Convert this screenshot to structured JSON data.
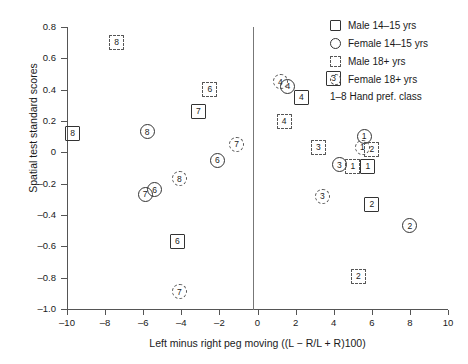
{
  "chart_data": {
    "type": "scatter",
    "title": "",
    "xlabel": "Left minus right peg moving ((L − R/L + R)100)",
    "ylabel": "Spatial test standard scores",
    "xlim": [
      -10,
      10
    ],
    "ylim": [
      -1.0,
      0.8
    ],
    "xticks": [
      -10,
      -8,
      -6,
      -4,
      -2,
      0,
      2,
      4,
      6,
      8,
      10
    ],
    "xtick_labels": [
      "–10",
      "–8",
      "–6",
      "–4",
      "–2",
      "0",
      "2",
      "4",
      "6",
      "8",
      "10"
    ],
    "yticks": [
      0.8,
      0.6,
      0.4,
      0.2,
      0,
      -0.2,
      -0.4,
      -0.6,
      -0.8,
      -1.0
    ],
    "ytick_labels": [
      "0.8",
      "0.6",
      "0.4",
      "0.2",
      "0",
      "–0.2",
      "–0.4",
      "–0.6",
      "–0.8",
      "–1.0"
    ],
    "grid": false,
    "reference_line_x": 0,
    "legend_position": "top-right",
    "legend": [
      {
        "marker": "square",
        "label": "Male 14–15 yrs"
      },
      {
        "marker": "circle",
        "label": "Female 14–15 yrs"
      },
      {
        "marker": "square-dashed",
        "label": "Male 18+ yrs"
      },
      {
        "marker": "circle-dashed",
        "label": "Female 18+ yrs"
      }
    ],
    "legend_note": "1–8 Hand pref. class",
    "point_label_meaning": "Hand preference class 1–8",
    "points": [
      {
        "x": -7.4,
        "y": 0.7,
        "marker": "square-dashed",
        "label": "8"
      },
      {
        "x": -9.7,
        "y": 0.12,
        "marker": "square",
        "label": "8"
      },
      {
        "x": -5.8,
        "y": 0.13,
        "marker": "circle",
        "label": "8"
      },
      {
        "x": -2.5,
        "y": 0.4,
        "marker": "square-dashed",
        "label": "6"
      },
      {
        "x": -3.1,
        "y": 0.26,
        "marker": "square",
        "label": "7"
      },
      {
        "x": -1.1,
        "y": 0.05,
        "marker": "circle-dashed",
        "label": "7"
      },
      {
        "x": -2.1,
        "y": -0.05,
        "marker": "circle",
        "label": "6"
      },
      {
        "x": -4.1,
        "y": -0.17,
        "marker": "circle-dashed",
        "label": "8"
      },
      {
        "x": -5.9,
        "y": -0.27,
        "marker": "circle",
        "label": "7"
      },
      {
        "x": -5.4,
        "y": -0.24,
        "marker": "circle",
        "label": "6"
      },
      {
        "x": -4.2,
        "y": -0.57,
        "marker": "square",
        "label": "6"
      },
      {
        "x": -4.1,
        "y": -0.89,
        "marker": "circle-dashed",
        "label": "7"
      },
      {
        "x": 1.2,
        "y": 0.45,
        "marker": "circle-dashed",
        "label": "4"
      },
      {
        "x": 1.6,
        "y": 0.42,
        "marker": "circle",
        "label": "4"
      },
      {
        "x": 2.3,
        "y": 0.35,
        "marker": "square",
        "label": "4"
      },
      {
        "x": 4.0,
        "y": 0.47,
        "marker": "square",
        "label": "3"
      },
      {
        "x": 1.4,
        "y": 0.2,
        "marker": "square-dashed",
        "label": "4"
      },
      {
        "x": 3.2,
        "y": 0.03,
        "marker": "square-dashed",
        "label": "3"
      },
      {
        "x": 5.6,
        "y": 0.1,
        "marker": "circle",
        "label": "1"
      },
      {
        "x": 5.5,
        "y": 0.03,
        "marker": "circle-dashed",
        "label": "1"
      },
      {
        "x": 6.0,
        "y": 0.02,
        "marker": "square-dashed",
        "label": "2"
      },
      {
        "x": 4.3,
        "y": -0.08,
        "marker": "circle",
        "label": "3"
      },
      {
        "x": 5.0,
        "y": -0.09,
        "marker": "square-dashed",
        "label": "1"
      },
      {
        "x": 5.8,
        "y": -0.09,
        "marker": "square",
        "label": "1"
      },
      {
        "x": 3.4,
        "y": -0.28,
        "marker": "circle-dashed",
        "label": "3"
      },
      {
        "x": 6.0,
        "y": -0.33,
        "marker": "square",
        "label": "2"
      },
      {
        "x": 8.0,
        "y": -0.47,
        "marker": "circle",
        "label": "2"
      },
      {
        "x": 5.3,
        "y": -0.79,
        "marker": "square-dashed",
        "label": "2"
      }
    ]
  }
}
